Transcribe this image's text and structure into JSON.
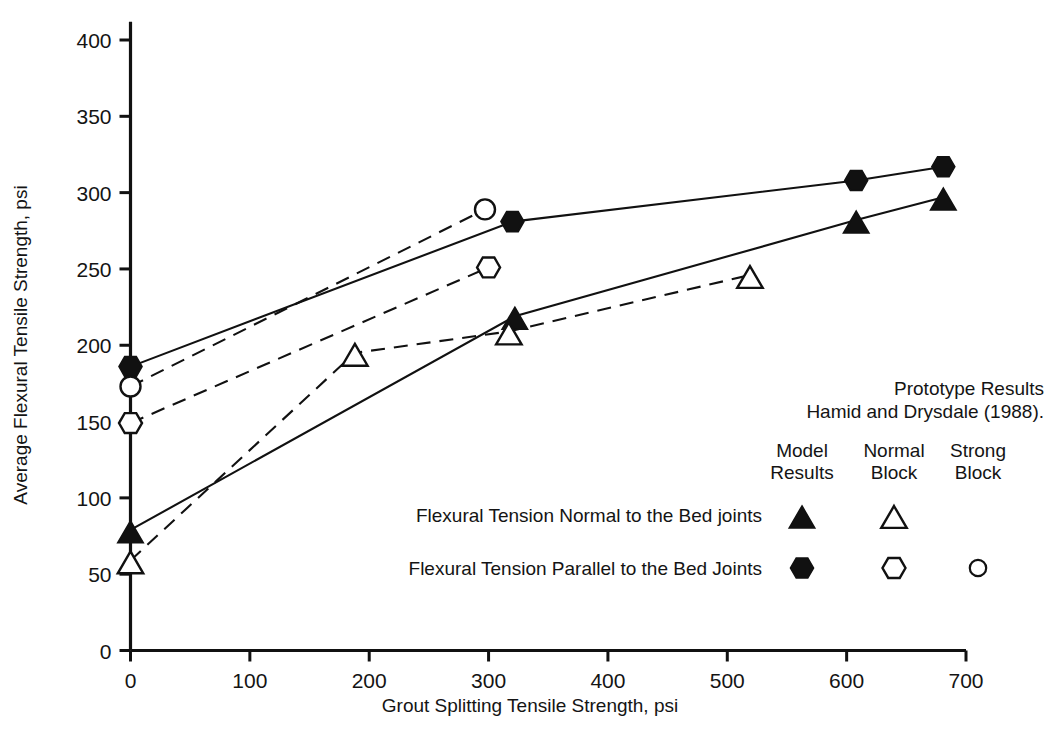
{
  "chart_data": {
    "type": "line",
    "title": "",
    "xlabel": "Grout Splitting Tensile Strength, psi",
    "ylabel": "Average Flexural Tensile Strength, psi",
    "xlim": [
      0,
      700
    ],
    "ylim": [
      0,
      400
    ],
    "xticks": [
      0,
      100,
      200,
      300,
      400,
      500,
      600,
      700
    ],
    "yticks": [
      0,
      50,
      100,
      150,
      200,
      250,
      300,
      350,
      400
    ],
    "grid": false,
    "legend_position": "inside-lower-right",
    "series": [
      {
        "name": "Flexural Tension Parallel to the Bed Joints - Model Results",
        "marker": "filled-hexagon",
        "line": "solid",
        "points": [
          {
            "x": 0,
            "y": 186
          },
          {
            "x": 320,
            "y": 281
          },
          {
            "x": 608,
            "y": 308
          },
          {
            "x": 681,
            "y": 317
          }
        ]
      },
      {
        "name": "Flexural Tension Parallel to the Bed Joints - Strong Block",
        "marker": "open-circle",
        "line": "dashed",
        "points": [
          {
            "x": 0,
            "y": 173
          },
          {
            "x": 297,
            "y": 289
          }
        ]
      },
      {
        "name": "Flexural Tension Parallel to the Bed Joints - Normal Block",
        "marker": "open-hexagon",
        "line": "dashed",
        "points": [
          {
            "x": 0,
            "y": 149
          },
          {
            "x": 300,
            "y": 251
          }
        ]
      },
      {
        "name": "Flexural Tension Normal to the Bed joints - Model Results",
        "marker": "filled-triangle",
        "line": "solid",
        "points": [
          {
            "x": 0,
            "y": 79
          },
          {
            "x": 322,
            "y": 219
          },
          {
            "x": 608,
            "y": 282
          },
          {
            "x": 681,
            "y": 297
          }
        ]
      },
      {
        "name": "Flexural Tension Normal to the Bed joints - Normal Block",
        "marker": "open-triangle",
        "line": "dashed",
        "points": [
          {
            "x": 0,
            "y": 59
          },
          {
            "x": 188,
            "y": 195
          },
          {
            "x": 317,
            "y": 209
          },
          {
            "x": 519,
            "y": 246
          }
        ]
      }
    ]
  },
  "axes": {
    "x_title": "Grout Splitting Tensile Strength, psi",
    "y_title": "Average Flexural Tensile Strength, psi",
    "x_tick_labels": [
      "0",
      "100",
      "200",
      "300",
      "400",
      "500",
      "600",
      "700"
    ],
    "y_tick_labels": [
      "0",
      "50",
      "100",
      "150",
      "200",
      "250",
      "300",
      "350",
      "400"
    ]
  },
  "legend": {
    "heading_line1": "Prototype Results",
    "heading_line2": "Hamid and Drysdale (1988).",
    "columns": [
      {
        "line1": "Model",
        "line2": "Results"
      },
      {
        "line1": "Normal",
        "line2": "Block"
      },
      {
        "line1": "Strong",
        "line2": "Block"
      }
    ],
    "rows": [
      {
        "label": "Flexural Tension Normal to the Bed joints",
        "markers": [
          "filled-triangle",
          "open-triangle",
          "none"
        ]
      },
      {
        "label": "Flexural Tension Parallel to the Bed Joints",
        "markers": [
          "filled-hexagon",
          "open-hexagon",
          "open-circle-small"
        ]
      }
    ]
  },
  "caption": {
    "partial_text": ""
  }
}
